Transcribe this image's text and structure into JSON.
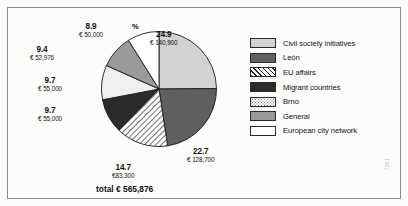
{
  "chart_data": {
    "type": "pie",
    "title": "",
    "unit_label": "%",
    "total_label": "total € 565,876",
    "total_value": 565876,
    "currency": "EUR",
    "legend_position": "right",
    "start_angle_deg": 0,
    "direction": "clockwise",
    "categories": [
      "Civil society initiatives",
      "León",
      "EU affairs",
      "Migrant countries",
      "Brno",
      "General",
      "European city network"
    ],
    "values": [
      24.9,
      22.7,
      14.7,
      9.7,
      9.7,
      9.4,
      8.9
    ],
    "amounts": [
      140900,
      128700,
      83300,
      55000,
      55000,
      52976,
      50000
    ],
    "slices": [
      {
        "name": "Civil society initiatives",
        "percent": "24.9",
        "amount": "€ 140,900",
        "value": 24.9,
        "fill": "light-gray",
        "color": "#d2d2d2"
      },
      {
        "name": "León",
        "percent": "22.7",
        "amount": "€ 128,700",
        "value": 22.7,
        "fill": "dark-gray",
        "color": "#5f5f5f"
      },
      {
        "name": "EU affairs",
        "percent": "14.7",
        "amount": "€83,300",
        "value": 14.7,
        "fill": "diagonal-hatch",
        "color": "#ffffff"
      },
      {
        "name": "Migrant countries",
        "percent": "9.7",
        "amount": "€ 55,000",
        "value": 9.7,
        "fill": "near-black",
        "color": "#2b2b2b"
      },
      {
        "name": "Brno",
        "percent": "9.7",
        "amount": "€ 55,000",
        "value": 9.7,
        "fill": "dotted",
        "color": "#ffffff"
      },
      {
        "name": "General",
        "percent": "9.4",
        "amount": "€ 52,976",
        "value": 9.4,
        "fill": "medium-gray",
        "color": "#9a9a9a"
      },
      {
        "name": "European city network",
        "percent": "8.9",
        "amount": "€ 50,000",
        "value": 8.9,
        "fill": "white",
        "color": "#ffffff"
      }
    ],
    "legend": [
      {
        "label": "Civil society initiatives",
        "swatch": "light-gray"
      },
      {
        "label": "León",
        "swatch": "dark-gray"
      },
      {
        "label": "EU affairs",
        "swatch": "diagonal-hatch"
      },
      {
        "label": "Migrant countries",
        "swatch": "near-black"
      },
      {
        "label": "Brno",
        "swatch": "dotted"
      },
      {
        "label": "General",
        "swatch": "medium-gray"
      },
      {
        "label": "European city network",
        "swatch": "white"
      }
    ]
  },
  "watermark": "7861"
}
